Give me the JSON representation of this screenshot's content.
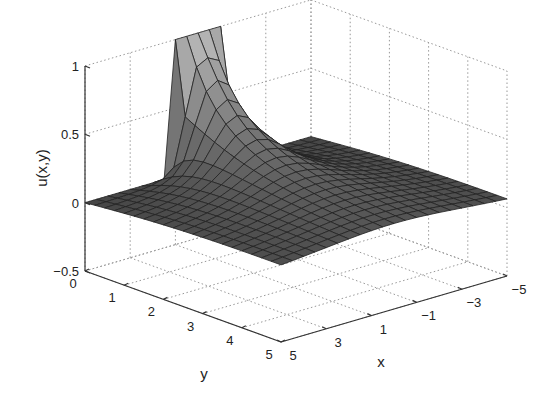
{
  "chart_data": {
    "type": "surface",
    "title": "",
    "xlabel": "x",
    "ylabel": "y",
    "zlabel": "u(x,y)",
    "xlim": [
      -5,
      5
    ],
    "ylim": [
      0,
      5
    ],
    "zlim": [
      -0.5,
      1
    ],
    "x_ticks": [
      "5",
      "3",
      "1",
      "-1",
      "-3",
      "-5"
    ],
    "y_ticks": [
      "0",
      "1",
      "2",
      "3",
      "4",
      "5"
    ],
    "z_ticks": [
      "-0.5",
      "0",
      "0.5",
      "1"
    ],
    "grid": "dotted",
    "colormap": "gray",
    "mesh": {
      "nx": 21,
      "ny": 21
    },
    "boundary": {
      "y0_plateau_x_range": [
        -1,
        1
      ],
      "plateau_value": 1
    }
  }
}
